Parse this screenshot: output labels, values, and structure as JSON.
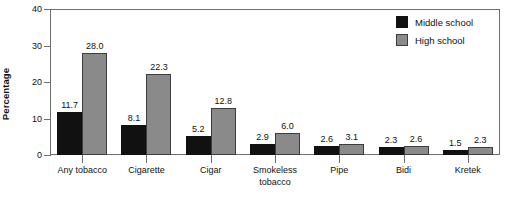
{
  "chart_data": {
    "type": "bar",
    "title": "",
    "xlabel": "",
    "ylabel": "Percentage",
    "ylim": [
      0,
      40
    ],
    "yticks": [
      0,
      10,
      20,
      30,
      40
    ],
    "ytick_labels": [
      "0",
      "10",
      "20",
      "30",
      "40"
    ],
    "grid": false,
    "legend_position": "top-right",
    "categories": [
      "Any tobacco",
      "Cigarette",
      "Cigar",
      "Smokeless tobacco",
      "Pipe",
      "Bidi",
      "Kretek"
    ],
    "category_lines": [
      [
        "Any tobacco"
      ],
      [
        "Cigarette"
      ],
      [
        "Cigar"
      ],
      [
        "Smokeless",
        "tobacco"
      ],
      [
        "Pipe"
      ],
      [
        "Bidi"
      ],
      [
        "Kretek"
      ]
    ],
    "series": [
      {
        "name": "Middle school",
        "color": "#111111",
        "values": [
          11.7,
          8.1,
          5.2,
          2.9,
          2.6,
          2.3,
          1.5
        ],
        "value_labels": [
          "11.7",
          "8.1",
          "5.2",
          "2.9",
          "2.6",
          "2.3",
          "1.5"
        ]
      },
      {
        "name": "High school",
        "color": "#8a8a8a",
        "values": [
          28.0,
          22.3,
          12.8,
          6.0,
          3.1,
          2.6,
          2.3
        ],
        "value_labels": [
          "28.0",
          "22.3",
          "12.8",
          "6.0",
          "3.1",
          "2.6",
          "2.3"
        ]
      }
    ]
  },
  "legend": {
    "items": [
      {
        "label": "Middle school",
        "swatch": "middle"
      },
      {
        "label": "High school",
        "swatch": "high"
      }
    ]
  }
}
